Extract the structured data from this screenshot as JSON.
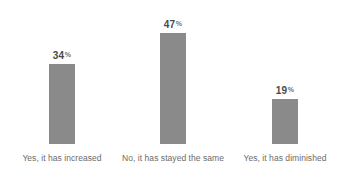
{
  "chart_data": {
    "type": "bar",
    "title": "",
    "subtitle": "",
    "xlabel": "",
    "ylabel": "",
    "categories": [
      "Yes, it has increased",
      "No, it has stayed the same",
      "Yes, it has diminished"
    ],
    "values": [
      34,
      47,
      19
    ],
    "value_labels": [
      "34",
      "47",
      "19"
    ],
    "value_unit": "%",
    "ylim": [
      0,
      61
    ],
    "grid": false,
    "legend": false,
    "legend_position": "none",
    "orientation": "vertical",
    "series": [
      {
        "name": "Share of respondents",
        "values": [
          34,
          47,
          19
        ]
      }
    ],
    "annotations": []
  },
  "style": {
    "background": "#ffffff",
    "bar_color": "#8a8a8a",
    "value_label_color": "#4a4a4a",
    "percent_glyph_color": "#6f6f6f",
    "category_label_color": "#6b6b6b"
  }
}
